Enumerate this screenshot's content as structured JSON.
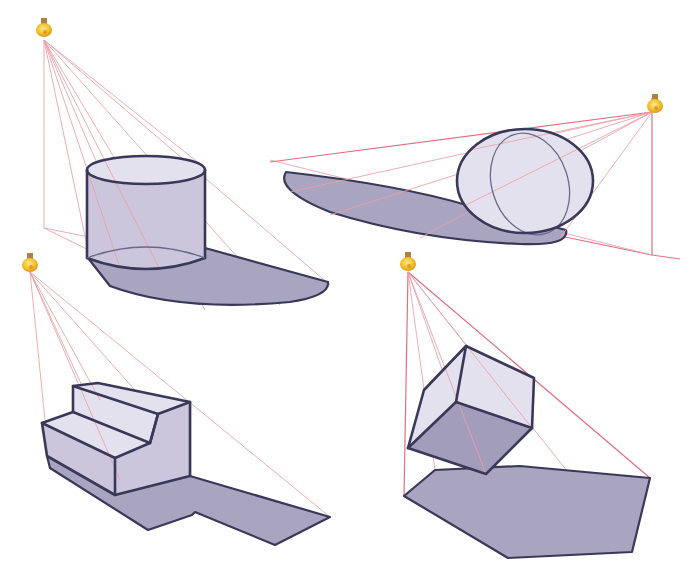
{
  "figure": {
    "title": "",
    "colors": {
      "ray": "#e8a0a8",
      "edge": "#3a3858",
      "shadow": "#a9a4c0",
      "face_light": "#e4e1ef",
      "bulb": "#f0c030"
    },
    "panels": [
      {
        "id": "cylinder",
        "object": "cylinder",
        "light": "light-bulb-icon"
      },
      {
        "id": "sphere",
        "object": "sphere",
        "light": "light-bulb-icon"
      },
      {
        "id": "steps",
        "object": "step block",
        "light": "light-bulb-icon"
      },
      {
        "id": "cube",
        "object": "floating cube",
        "light": "light-bulb-icon"
      }
    ]
  }
}
